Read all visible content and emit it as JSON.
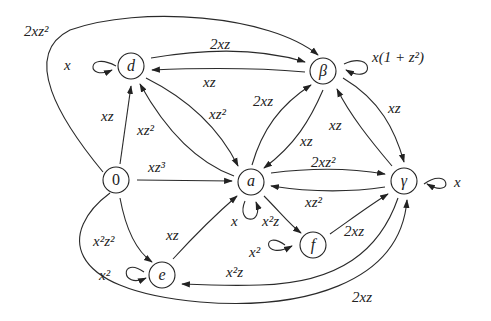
{
  "diagram": {
    "type": "directed-graph",
    "nodes": [
      {
        "id": "d",
        "label": "d",
        "x": 131,
        "y": 66
      },
      {
        "id": "beta",
        "label": "β",
        "x": 323,
        "y": 71
      },
      {
        "id": "zero",
        "label": "0",
        "x": 116,
        "y": 180
      },
      {
        "id": "a",
        "label": "a",
        "x": 251,
        "y": 182
      },
      {
        "id": "gamma",
        "label": "γ",
        "x": 404,
        "y": 181
      },
      {
        "id": "f",
        "label": "f",
        "x": 313,
        "y": 245
      },
      {
        "id": "e",
        "label": "e",
        "x": 162,
        "y": 275
      }
    ],
    "edges": [
      {
        "from": "zero",
        "to": "beta",
        "label": "2xz²"
      },
      {
        "from": "d",
        "to": "d",
        "label": "x"
      },
      {
        "from": "d",
        "to": "beta",
        "label": "2xz"
      },
      {
        "from": "beta",
        "to": "d",
        "label": "xz"
      },
      {
        "from": "beta",
        "to": "beta",
        "label": "x(1 + z²)"
      },
      {
        "from": "zero",
        "to": "d",
        "label": "xz"
      },
      {
        "from": "a",
        "to": "d",
        "label": "xz²"
      },
      {
        "from": "d",
        "to": "a",
        "label": "xz²"
      },
      {
        "from": "a",
        "to": "beta",
        "label": "2xz"
      },
      {
        "from": "beta",
        "to": "a",
        "label": "xz"
      },
      {
        "from": "gamma",
        "to": "beta",
        "label": "xz"
      },
      {
        "from": "beta",
        "to": "gamma",
        "label": "xz"
      },
      {
        "from": "zero",
        "to": "a",
        "label": "xz³"
      },
      {
        "from": "a",
        "to": "gamma",
        "label": "2xz²"
      },
      {
        "from": "gamma",
        "to": "a",
        "label": "xz²"
      },
      {
        "from": "gamma",
        "to": "gamma",
        "label": "x"
      },
      {
        "from": "a",
        "to": "a",
        "label": "x"
      },
      {
        "from": "a",
        "to": "f",
        "label": "x²z"
      },
      {
        "from": "f",
        "to": "f",
        "label": "x²"
      },
      {
        "from": "f",
        "to": "gamma",
        "label": "2xz"
      },
      {
        "from": "zero",
        "to": "e",
        "label": "x²z²"
      },
      {
        "from": "e",
        "to": "a",
        "label": "xz"
      },
      {
        "from": "e",
        "to": "e",
        "label": "x²"
      },
      {
        "from": "gamma",
        "to": "e",
        "label": "x²z"
      },
      {
        "from": "zero",
        "to": "gamma",
        "label": "2xz"
      }
    ]
  },
  "labels": {
    "n_d": "d",
    "n_beta": "β",
    "n_zero": "0",
    "n_a": "a",
    "n_gamma": "γ",
    "n_f": "f",
    "n_e": "e",
    "e_zero_beta": "2xz²",
    "e_d_loop": "x",
    "e_d_beta": "2xz",
    "e_beta_d": "xz",
    "e_beta_loop": "x(1 + z²)",
    "e_zero_d": "xz",
    "e_a_d": "xz²",
    "e_d_a": "xz²",
    "e_a_beta": "2xz",
    "e_beta_a": "xz",
    "e_gamma_beta": "xz",
    "e_beta_gamma": "xz",
    "e_zero_a": "xz³",
    "e_a_gamma": "2xz²",
    "e_gamma_a": "xz²",
    "e_gamma_loop": "x",
    "e_a_loop": "x",
    "e_a_f": "x²z",
    "e_f_loop": "x²",
    "e_f_gamma": "2xz",
    "e_zero_e": "x²z²",
    "e_e_a": "xz",
    "e_e_loop": "x²",
    "e_gamma_e": "x²z",
    "e_zero_gamma": "2xz"
  }
}
